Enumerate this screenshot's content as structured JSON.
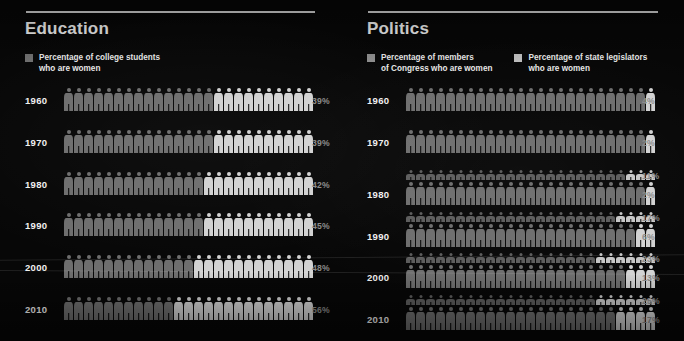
{
  "meta": {
    "background_color": "#070707",
    "rule_color": "#d8d8d8",
    "title_color": "#f2f2f2",
    "year_color": "#f0f0f0",
    "percent_color": "#8a8a8a",
    "figure_base_color": "#6e6e6e",
    "figure_highlight_color": "#d2d2d2",
    "figure_small_color": "#5c5c5c",
    "figure_small_highlight_color": "#c6c6c6"
  },
  "chart_data": {
    "type": "bar",
    "chart_style": "pictogram (isotype) rows of 25 human figures, highlighted figures encode the percentage",
    "units_per_row": 25,
    "panels": [
      {
        "id": "education",
        "title": "Education",
        "legend": [
          {
            "swatch_color": "#6e6e6e",
            "label": "Percentage of college students\nwho are women"
          }
        ],
        "categories": [
          "1960",
          "1970",
          "1980",
          "1990",
          "2000",
          "2010"
        ],
        "series": [
          {
            "name": "Percentage of college students who are women",
            "swatch_color": "#6e6e6e",
            "values": [
              39,
              39,
              42,
              45,
              48,
              56
            ],
            "labels": [
              "39%",
              "39%",
              "42%",
              "45%",
              "48%",
              "56%"
            ],
            "figures_total": 25,
            "figures_highlighted": [
              10,
              10,
              11,
              11,
              12,
              14
            ],
            "figure_size": "large"
          }
        ]
      },
      {
        "id": "politics",
        "title": "Politics",
        "legend": [
          {
            "swatch_color": "#8c8c8c",
            "label": "Percentage of members\nof Congress who are women"
          },
          {
            "swatch_color": "#bdbdbd",
            "label": "Percentage of state legislators\nwho are women"
          }
        ],
        "categories": [
          "1960",
          "1970",
          "1980",
          "1990",
          "2000",
          "2010"
        ],
        "series": [
          {
            "name": "Percentage of state legislators who are women",
            "swatch_color": "#bdbdbd",
            "values": [
              null,
              null,
              11,
              17,
              23,
              25
            ],
            "labels": [
              "",
              "",
              "11%",
              "17%",
              "23%",
              "25%"
            ],
            "figures_total": 25,
            "figures_highlighted": [
              0,
              0,
              3,
              4,
              6,
              6
            ],
            "figure_size": "small",
            "position": "upper"
          },
          {
            "name": "Percentage of members of Congress who are women",
            "swatch_color": "#8c8c8c",
            "values": [
              4,
              2,
              2,
              6,
              13,
              17
            ],
            "labels": [
              "4%",
              "2%",
              "2%",
              "6%",
              "13%",
              "17%"
            ],
            "figures_total": 25,
            "figures_highlighted": [
              1,
              1,
              1,
              2,
              3,
              4
            ],
            "figure_size": "large",
            "position": "lower"
          }
        ]
      }
    ]
  }
}
